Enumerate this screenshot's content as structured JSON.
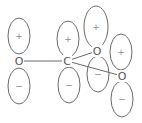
{
  "diagram": {
    "title": "",
    "atoms": [
      {
        "id": "O1",
        "label": "O",
        "x": 19,
        "y": 61
      },
      {
        "id": "C",
        "label": "C",
        "x": 67,
        "y": 61
      },
      {
        "id": "O2",
        "label": "O",
        "x": 97,
        "y": 51
      },
      {
        "id": "O3",
        "label": "O",
        "x": 122,
        "y": 76
      }
    ],
    "bonds": [
      {
        "from": "O1",
        "to": "C"
      },
      {
        "from": "C",
        "to": "O2"
      },
      {
        "from": "C",
        "to": "O3"
      }
    ],
    "lobes": [
      {
        "atom": "O1",
        "sign": "+",
        "cx": 19,
        "cy": 36,
        "rx": 11,
        "ry": 18
      },
      {
        "atom": "O1",
        "sign": "−",
        "cx": 19,
        "cy": 86,
        "rx": 11,
        "ry": 18
      },
      {
        "atom": "C",
        "sign": "+",
        "cx": 68,
        "cy": 39,
        "rx": 11,
        "ry": 18
      },
      {
        "atom": "C",
        "sign": "−",
        "cx": 69,
        "cy": 85,
        "rx": 11,
        "ry": 18
      },
      {
        "atom": "O2",
        "sign": "+",
        "cx": 96,
        "cy": 27,
        "rx": 12,
        "ry": 21
      },
      {
        "atom": "O2",
        "sign": "−",
        "cx": 98,
        "cy": 74,
        "rx": 11,
        "ry": 18
      },
      {
        "atom": "O3",
        "sign": "+",
        "cx": 121,
        "cy": 52,
        "rx": 11,
        "ry": 18
      },
      {
        "atom": "O3",
        "sign": "−",
        "cx": 122,
        "cy": 99,
        "rx": 11,
        "ry": 18
      }
    ]
  }
}
